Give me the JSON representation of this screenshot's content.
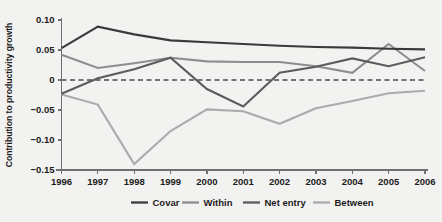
{
  "chart_data": {
    "type": "line",
    "title": "",
    "xlabel": "",
    "ylabel": "Contribution to productivity growth",
    "categories": [
      "1996",
      "1997",
      "1998",
      "1999",
      "2000",
      "2001",
      "2002",
      "2003",
      "2004",
      "2005",
      "2006"
    ],
    "x": [
      1996,
      1997,
      1998,
      1999,
      2000,
      2001,
      2002,
      2003,
      2004,
      2005,
      2006
    ],
    "xlim": [
      1996,
      2006
    ],
    "ylim": [
      -0.15,
      0.1
    ],
    "yticks": [
      0.1,
      0.05,
      0,
      -0.05,
      -0.1,
      -0.15
    ],
    "ytick_labels": [
      "0.10",
      "0.05",
      "0",
      "−0.05",
      "−0.10",
      "−0.15"
    ],
    "grid": false,
    "zero_reference_line": 0,
    "legend_position": "bottom",
    "series": [
      {
        "name": "Covar",
        "color": "#3a3a3a",
        "values": [
          0.053,
          0.089,
          0.076,
          0.066,
          0.063,
          0.06,
          0.057,
          0.055,
          0.054,
          0.052,
          0.051
        ]
      },
      {
        "name": "Within",
        "color": "#8d8d8d",
        "values": [
          0.042,
          0.02,
          0.028,
          0.037,
          0.031,
          0.03,
          0.03,
          0.023,
          0.012,
          0.06,
          0.015
        ]
      },
      {
        "name": "Net entry",
        "color": "#5c5c5c",
        "values": [
          -0.023,
          0.003,
          0.018,
          0.037,
          -0.015,
          -0.044,
          0.012,
          0.022,
          0.036,
          0.023,
          0.038
        ]
      },
      {
        "name": "Between",
        "color": "#ababab",
        "values": [
          -0.024,
          -0.041,
          -0.14,
          -0.085,
          -0.049,
          -0.052,
          -0.073,
          -0.047,
          -0.035,
          -0.022,
          -0.018
        ]
      }
    ]
  },
  "legend": {
    "entries": [
      {
        "label": "Covar",
        "color": "#3a3a3a"
      },
      {
        "label": "Within",
        "color": "#8d8d8d"
      },
      {
        "label": "Net entry",
        "color": "#5c5c5c"
      },
      {
        "label": "Between",
        "color": "#ababab"
      }
    ]
  },
  "axes": {
    "y_axis_title": "Contribution to productivity growth",
    "y_tick_labels": [
      "0.10",
      "0.05",
      "0",
      "−0.05",
      "−0.10",
      "−0.15"
    ],
    "x_tick_labels": [
      "1996",
      "1997",
      "1998",
      "1999",
      "2000",
      "2001",
      "2002",
      "2003",
      "2004",
      "2005",
      "2006"
    ]
  },
  "colors": {
    "background": "#f2f2f0",
    "axis": "#6f6f6f",
    "text": "#1c1c1c",
    "zero_line": "#4a4a4a"
  }
}
